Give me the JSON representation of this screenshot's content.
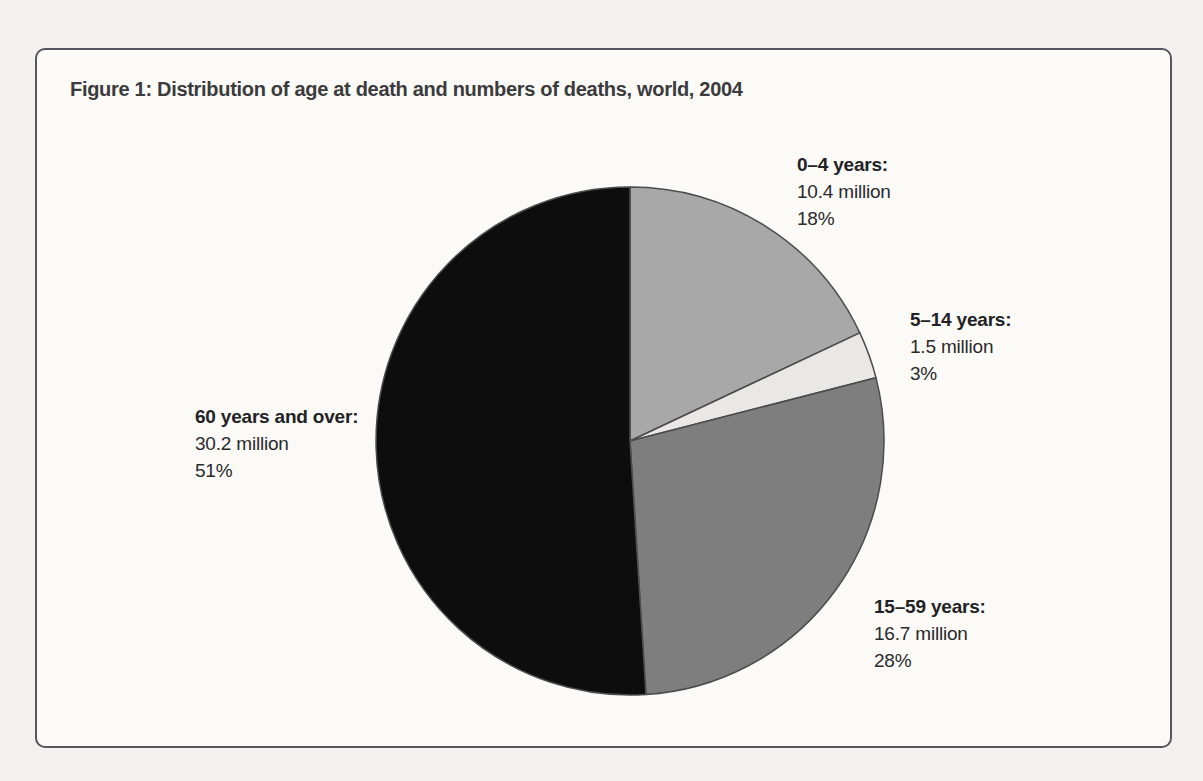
{
  "figure": {
    "title": "Figure 1: Distribution of age at death and numbers of deaths, world, 2004"
  },
  "chart_data": {
    "type": "pie",
    "title": "Figure 1: Distribution of age at death and numbers of deaths, world, 2004",
    "categories": [
      "0–4 years",
      "5–14 years",
      "15–59 years",
      "60 years and over"
    ],
    "values_millions": [
      10.4,
      1.5,
      16.7,
      30.2
    ],
    "percents": [
      18,
      3,
      28,
      51
    ],
    "units": "million deaths",
    "start_angle_deg": 0,
    "direction": "clockwise",
    "stroke_color": "#4b4c4e",
    "slices": [
      {
        "category": "0–4 years",
        "label": "0–4 years:",
        "value_label": "10.4 million",
        "percent_label": "18%",
        "value_millions": 10.4,
        "percent": 18,
        "color": "#a8a8a8"
      },
      {
        "category": "5–14 years",
        "label": "5–14 years:",
        "value_label": "1.5 million",
        "percent_label": "3%",
        "value_millions": 1.5,
        "percent": 3,
        "color": "#e9e8e4"
      },
      {
        "category": "15–59 years",
        "label": "15–59 years:",
        "value_label": "16.7 million",
        "percent_label": "28%",
        "value_millions": 16.7,
        "percent": 28,
        "color": "#7e7e7e"
      },
      {
        "category": "60 years and over",
        "label": "60 years and over:",
        "value_label": "30.2 million",
        "percent_label": "51%",
        "value_millions": 30.2,
        "percent": 51,
        "color": "#0d0d0e"
      }
    ]
  }
}
